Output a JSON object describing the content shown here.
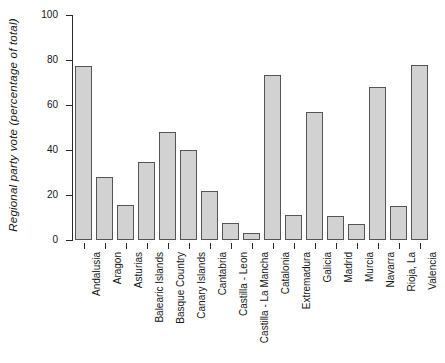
{
  "chart_data": {
    "type": "bar",
    "title": "",
    "xlabel": "",
    "ylabel": "Regional party vote (percentage of  total)",
    "ylim": [
      0,
      100
    ],
    "yticks": [
      0,
      20,
      40,
      60,
      80,
      100
    ],
    "grid": false,
    "legend": false,
    "categories": [
      "Andalusia",
      "Aragon",
      "Asturias",
      "Balearic Islands",
      "Basque Country",
      "Canary Islands",
      "Cantabria",
      "Castilla - Leon",
      "Castilla - La Mancha",
      "Catalonia",
      "Extremadura",
      "Galicia",
      "Madrid",
      "Murcia",
      "Navarra",
      "Rioja, La",
      "Valencia"
    ],
    "values": [
      77.5,
      28,
      15.5,
      34.5,
      48,
      40,
      22,
      7.5,
      3,
      73.5,
      11,
      57,
      10.5,
      7,
      68,
      15,
      78
    ],
    "bar_fill": "#d2d2d2",
    "bar_stroke": "#555555",
    "axis_color": "#2b2b2b"
  }
}
